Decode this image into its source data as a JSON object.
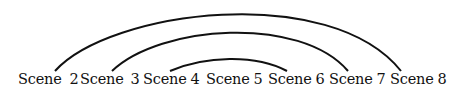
{
  "diagram": {
    "type": "chiastic-arc-diagram",
    "scenes": [
      {
        "id": "scene-2",
        "word": "Scene",
        "number": "2",
        "x": 18
      },
      {
        "id": "scene-3",
        "word": "Scene",
        "number": "3",
        "x": 80
      },
      {
        "id": "scene-4",
        "word": "Scene",
        "number": "4",
        "x": 143
      },
      {
        "id": "scene-5",
        "word": "Scene",
        "number": "5",
        "x": 206
      },
      {
        "id": "scene-6",
        "word": "Scene",
        "number": "6",
        "x": 268
      },
      {
        "id": "scene-7",
        "word": "Scene",
        "number": "7",
        "x": 329
      },
      {
        "id": "scene-8",
        "word": "Scene",
        "number": "8",
        "x": 390
      }
    ],
    "connections": [
      {
        "from": "Scene 2",
        "to": "Scene 8",
        "level": "outer"
      },
      {
        "from": "Scene 3",
        "to": "Scene 7",
        "level": "middle"
      },
      {
        "from": "Scene 4",
        "to": "Scene 6",
        "level": "inner"
      }
    ],
    "center": "Scene 5",
    "colors": {
      "line": "#111111",
      "text": "#111111",
      "background": "#ffffff"
    }
  }
}
